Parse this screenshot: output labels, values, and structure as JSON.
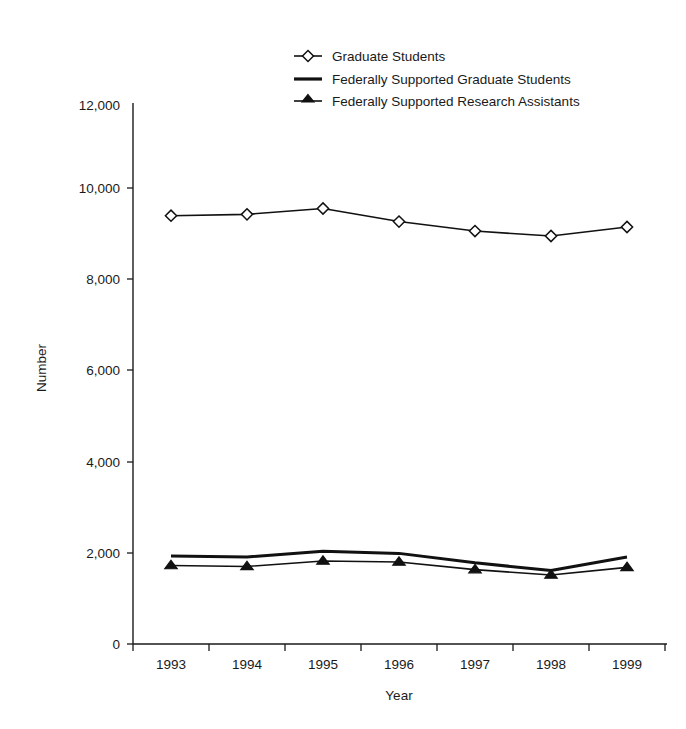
{
  "chart_data": {
    "type": "line",
    "title": "",
    "subtitle": "",
    "xlabel": "Year",
    "ylabel": "Number",
    "x": [
      "1993",
      "1994",
      "1995",
      "1996",
      "1997",
      "1998",
      "1999"
    ],
    "categories": [
      "1993",
      "1994",
      "1995",
      "1996",
      "1997",
      "1998",
      "1999"
    ],
    "xlim": [
      "1993",
      "1999"
    ],
    "ylim": [
      0,
      12000
    ],
    "yticks": [
      0,
      2000,
      4000,
      6000,
      8000,
      10000,
      12000
    ],
    "ytick_labels": [
      "0",
      "2,000",
      "4,000",
      "6,000",
      "8,000",
      "10,000",
      "12,000"
    ],
    "xtick_labels": [
      "1993",
      "1994",
      "1995",
      "1996",
      "1997",
      "1998",
      "1999"
    ],
    "grid": false,
    "legend_position": "top-center",
    "series": [
      {
        "name": "Graduate Students",
        "marker": "open-diamond",
        "line_weight": "thin",
        "color": "#111111",
        "values": [
          9500,
          9530,
          9660,
          9370,
          9160,
          9050,
          9250
        ]
      },
      {
        "name": "Federally Supported Graduate Students",
        "marker": "none",
        "line_weight": "thick",
        "color": "#111111",
        "values": [
          1950,
          1930,
          2060,
          2010,
          1800,
          1630,
          1930
        ]
      },
      {
        "name": "Federally Supported Research Assistants",
        "marker": "filled-triangle",
        "line_weight": "thin",
        "color": "#111111",
        "values": [
          1740,
          1720,
          1840,
          1820,
          1650,
          1530,
          1700
        ]
      }
    ]
  },
  "legend": {
    "items": [
      {
        "label": "Graduate Students",
        "marker": "open-diamond"
      },
      {
        "label": "Federally Supported Graduate Students",
        "marker": "plain-line"
      },
      {
        "label": "Federally Supported Research Assistants",
        "marker": "filled-triangle"
      }
    ]
  },
  "axes": {
    "x_title": "Year",
    "y_title": "Number",
    "y_labels": [
      "12,000",
      "10,000",
      "8,000",
      "6,000",
      "4,000",
      "2,000",
      "0"
    ],
    "x_labels": [
      "1993",
      "1994",
      "1995",
      "1996",
      "1997",
      "1998",
      "1999"
    ]
  }
}
